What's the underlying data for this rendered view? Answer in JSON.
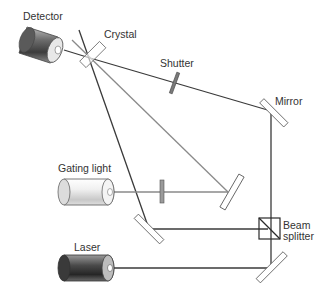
{
  "diagram": {
    "colors": {
      "beam_dark": "#3a3a3a",
      "beam_gray": "#8a8a8a",
      "component_outline": "#555555",
      "filter_fill": "#9a9a9a"
    },
    "components": {
      "detector": {
        "label": "Detector",
        "icon": "cylinder-dark-gray"
      },
      "crystal": {
        "label": "Crystal",
        "icon": "rectangle-plate"
      },
      "shutter": {
        "label": "Shutter",
        "icon": "gray-bar"
      },
      "mirror": {
        "label": "Mirror",
        "icon": "rectangle-plate"
      },
      "gating_light": {
        "label": "Gating light",
        "icon": "cylinder-light"
      },
      "beam_splitter": {
        "label_line1": "Beam",
        "label_line2": "splitter",
        "icon": "square-with-diagonal"
      },
      "laser": {
        "label": "Laser",
        "icon": "cylinder-dark"
      }
    }
  }
}
